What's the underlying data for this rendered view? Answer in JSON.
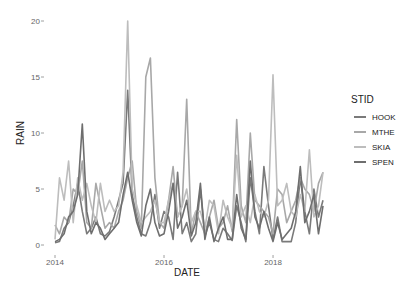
{
  "chart_data": {
    "type": "line",
    "title": "",
    "xlabel": "DATE",
    "ylabel": "RAIN",
    "x_tick_labels": [
      "2014",
      "2016",
      "2018"
    ],
    "y_tick_labels": [
      "0",
      "5",
      "10",
      "15",
      "20"
    ],
    "ylim": [
      0,
      20.5
    ],
    "xlim": [
      "2014-01",
      "2018-12"
    ],
    "grid": false,
    "legend": {
      "title": "STID",
      "position": "right",
      "entries": [
        "HOOK",
        "MTHE",
        "SKIA",
        "SPEN"
      ]
    },
    "x": [
      "2014-01",
      "2014-02",
      "2014-03",
      "2014-04",
      "2014-05",
      "2014-06",
      "2014-07",
      "2014-08",
      "2014-09",
      "2014-10",
      "2014-11",
      "2014-12",
      "2015-01",
      "2015-02",
      "2015-03",
      "2015-04",
      "2015-05",
      "2015-06",
      "2015-07",
      "2015-08",
      "2015-09",
      "2015-10",
      "2015-11",
      "2015-12",
      "2016-01",
      "2016-02",
      "2016-03",
      "2016-04",
      "2016-05",
      "2016-06",
      "2016-07",
      "2016-08",
      "2016-09",
      "2016-10",
      "2016-11",
      "2016-12",
      "2017-01",
      "2017-02",
      "2017-03",
      "2017-04",
      "2017-05",
      "2017-06",
      "2017-07",
      "2017-08",
      "2017-09",
      "2017-10",
      "2017-11",
      "2017-12",
      "2018-01",
      "2018-02",
      "2018-03",
      "2018-04",
      "2018-05",
      "2018-06",
      "2018-07",
      "2018-08",
      "2018-09",
      "2018-10",
      "2018-11",
      "2018-12"
    ],
    "series": [
      {
        "name": "HOOK",
        "color": "#7a7a7a",
        "values": [
          0.2,
          0.3,
          1.5,
          2.0,
          3.5,
          5.5,
          3.0,
          1.0,
          1.5,
          2.5,
          1.0,
          0.8,
          1.2,
          2.5,
          4.0,
          5.5,
          13.8,
          4.5,
          2.5,
          1.0,
          0.8,
          2.0,
          4.5,
          1.5,
          3.0,
          2.5,
          0.5,
          6.5,
          1.0,
          2.0,
          0.3,
          1.0,
          5.0,
          0.8,
          2.0,
          0.5,
          0.3,
          1.5,
          1.0,
          0.4,
          3.5,
          2.0,
          0.3,
          6.0,
          3.0,
          1.0,
          7.0,
          3.5,
          0.5,
          2.5,
          0.3,
          0.3,
          0.3,
          2.0,
          6.0,
          3.0,
          1.0,
          5.0,
          2.5,
          4.0
        ]
      },
      {
        "name": "MTHE",
        "color": "#a8a8a8",
        "values": [
          1.8,
          1.0,
          2.5,
          2.0,
          5.0,
          4.5,
          7.5,
          2.0,
          1.5,
          5.5,
          3.5,
          1.5,
          2.0,
          1.5,
          3.0,
          4.0,
          6.0,
          7.5,
          3.0,
          1.5,
          15.0,
          16.7,
          6.0,
          2.0,
          1.5,
          4.0,
          7.0,
          2.5,
          3.5,
          13.0,
          1.0,
          3.0,
          2.0,
          1.0,
          2.5,
          4.0,
          1.5,
          2.0,
          3.5,
          1.2,
          11.2,
          3.5,
          2.0,
          10.0,
          4.0,
          3.5,
          3.0,
          2.5,
          1.0,
          5.0,
          4.5,
          2.0,
          3.0,
          4.0,
          6.0,
          5.0,
          4.5,
          3.0,
          5.5,
          6.5
        ]
      },
      {
        "name": "SKIA",
        "color": "#bdbdbd",
        "values": [
          0.5,
          6.0,
          4.0,
          7.5,
          2.0,
          6.0,
          4.0,
          5.5,
          3.5,
          2.0,
          5.5,
          3.0,
          4.0,
          3.0,
          3.5,
          6.5,
          20.0,
          5.0,
          3.5,
          2.0,
          2.5,
          3.0,
          4.0,
          2.0,
          2.0,
          4.0,
          5.5,
          2.5,
          3.5,
          5.0,
          2.0,
          3.0,
          3.0,
          1.5,
          4.0,
          3.5,
          1.0,
          4.0,
          2.5,
          1.5,
          8.0,
          2.5,
          3.5,
          2.0,
          4.5,
          3.0,
          2.5,
          4.0,
          15.2,
          3.5,
          4.0,
          5.5,
          3.0,
          2.5,
          4.5,
          3.0,
          8.5,
          2.5,
          3.5,
          6.5
        ]
      },
      {
        "name": "SPEN",
        "color": "#6e6e6e",
        "values": [
          0.3,
          0.5,
          1.0,
          2.5,
          3.0,
          4.5,
          10.8,
          3.0,
          1.0,
          2.0,
          1.5,
          0.5,
          1.0,
          1.5,
          2.0,
          4.5,
          6.5,
          4.0,
          2.0,
          0.8,
          3.5,
          5.0,
          2.0,
          0.8,
          1.0,
          3.0,
          5.5,
          1.5,
          2.5,
          4.0,
          0.8,
          2.0,
          5.5,
          0.5,
          2.5,
          0.3,
          1.5,
          2.5,
          0.5,
          0.5,
          4.5,
          1.5,
          0.5,
          7.5,
          2.5,
          1.5,
          3.0,
          1.5,
          0.3,
          2.0,
          0.5,
          1.0,
          1.5,
          3.0,
          7.0,
          2.0,
          3.0,
          4.5,
          1.0,
          3.5
        ]
      }
    ]
  },
  "axes": {
    "x_title": "DATE",
    "y_title": "RAIN",
    "x_ticks": [
      {
        "label": "2014",
        "index": 0
      },
      {
        "label": "2016",
        "index": 24
      },
      {
        "label": "2018",
        "index": 48
      }
    ],
    "y_ticks": [
      {
        "label": "0",
        "value": 0
      },
      {
        "label": "5",
        "value": 5
      },
      {
        "label": "10",
        "value": 10
      },
      {
        "label": "15",
        "value": 15
      },
      {
        "label": "20",
        "value": 20
      }
    ]
  },
  "legend": {
    "title": "STID",
    "items": [
      {
        "label": "HOOK",
        "color": "#7a7a7a"
      },
      {
        "label": "MTHE",
        "color": "#a8a8a8"
      },
      {
        "label": "SKIA",
        "color": "#bdbdbd"
      },
      {
        "label": "SPEN",
        "color": "#6e6e6e"
      }
    ]
  }
}
